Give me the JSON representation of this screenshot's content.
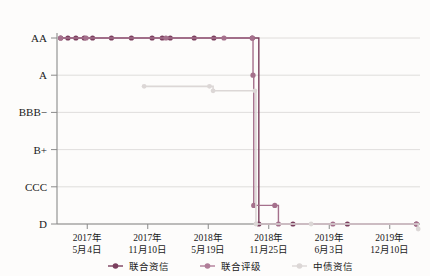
{
  "chart_data": {
    "type": "line",
    "title": "",
    "xlabel": "",
    "ylabel": "",
    "grid": true,
    "legend_position": "bottom",
    "y_categories": [
      "AA",
      "A",
      "BBB−",
      "B+",
      "CCC",
      "D"
    ],
    "x_tick_labels": [
      {
        "year": "2017年",
        "date": "5月4日"
      },
      {
        "year": "2017年",
        "date": "11月10日"
      },
      {
        "year": "2018年",
        "date": "5月19日"
      },
      {
        "year": "2018年",
        "date": "11月25日"
      },
      {
        "year": "2019年",
        "date": "6月3日"
      },
      {
        "year": "2019年",
        "date": "12月10日"
      }
    ],
    "series": [
      {
        "name": "联合资信",
        "color": "#7b3f5e",
        "step": true,
        "points": [
          {
            "x": 0.01,
            "y": "AA"
          },
          {
            "x": 0.03,
            "y": "AA"
          },
          {
            "x": 0.052,
            "y": "AA"
          },
          {
            "x": 0.075,
            "y": "AA"
          },
          {
            "x": 0.098,
            "y": "AA"
          },
          {
            "x": 0.15,
            "y": "AA"
          },
          {
            "x": 0.205,
            "y": "AA"
          },
          {
            "x": 0.262,
            "y": "AA"
          },
          {
            "x": 0.29,
            "y": "AA"
          },
          {
            "x": 0.312,
            "y": "AA"
          },
          {
            "x": 0.378,
            "y": "AA"
          },
          {
            "x": 0.432,
            "y": "AA"
          },
          {
            "x": 0.538,
            "y": "AA"
          },
          {
            "x": 0.556,
            "y": "D"
          },
          {
            "x": 0.65,
            "y": "D"
          },
          {
            "x": 0.8,
            "y": "D"
          },
          {
            "x": 0.99,
            "y": "D"
          }
        ]
      },
      {
        "name": "联合评级",
        "color": "#a5708c",
        "step": true,
        "points": [
          {
            "x": 0.01,
            "y": "AA"
          },
          {
            "x": 0.08,
            "y": "AA"
          },
          {
            "x": 0.3,
            "y": "AA"
          },
          {
            "x": 0.46,
            "y": "AA"
          },
          {
            "x": 0.538,
            "y": "AA"
          },
          {
            "x": 0.54,
            "y": "A"
          },
          {
            "x": 0.542,
            "y": "CCC-low"
          },
          {
            "x": 0.6,
            "y": "CCC-low"
          },
          {
            "x": 0.61,
            "y": "D"
          },
          {
            "x": 0.76,
            "y": "D"
          },
          {
            "x": 0.99,
            "y": "D"
          }
        ]
      },
      {
        "name": "中债资信",
        "color": "#dcd7d6",
        "step": true,
        "points": [
          {
            "x": 0.24,
            "y": "A-low"
          },
          {
            "x": 0.42,
            "y": "A-low"
          },
          {
            "x": 0.43,
            "y": "BBB-high"
          },
          {
            "x": 0.545,
            "y": "BBB-high"
          },
          {
            "x": 0.548,
            "y": "D"
          },
          {
            "x": 0.7,
            "y": "D"
          },
          {
            "x": 0.995,
            "y": "D-low"
          }
        ]
      }
    ],
    "legend": [
      {
        "label": "联合资信",
        "color": "#7b3f5e"
      },
      {
        "label": "联合评级",
        "color": "#b07d98"
      },
      {
        "label": "中债资信",
        "color": "#dcd7d6"
      }
    ],
    "colors": {
      "axis": "#8a8a8a",
      "grid": "#d8d5d4",
      "background": "#fdfcfb",
      "text": "#1a1a1a"
    }
  }
}
